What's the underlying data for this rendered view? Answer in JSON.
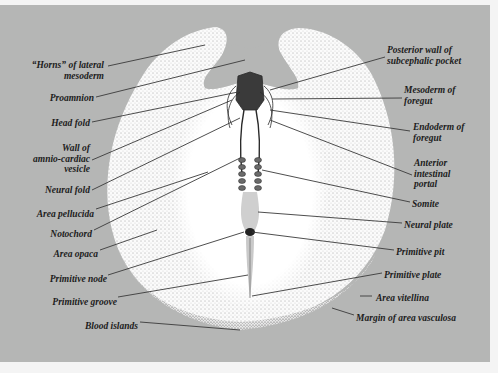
{
  "diagram": {
    "colors": {
      "background": "#b5b6b5",
      "embryo": "#ffffff",
      "text": "#1c1c1c",
      "leader": "#3a3a3a"
    },
    "labels_left": [
      {
        "id": "horns",
        "line1": "“Horns” of lateral",
        "line2": "mesoderm"
      },
      {
        "id": "proamnion",
        "line1": "Proamnion"
      },
      {
        "id": "head-fold",
        "line1": "Head fold"
      },
      {
        "id": "wall-amnio",
        "line1": "Wall of",
        "line2": "amnio-cardiac",
        "line3": "vesicle"
      },
      {
        "id": "neural-fold",
        "line1": "Neural fold"
      },
      {
        "id": "area-pellucida",
        "line1": "Area pellucida"
      },
      {
        "id": "notochord",
        "line1": "Notochord"
      },
      {
        "id": "area-opaca",
        "line1": "Area opaca"
      },
      {
        "id": "primitive-node",
        "line1": "Primitive node"
      },
      {
        "id": "primitive-groove",
        "line1": "Primitive groove"
      },
      {
        "id": "blood-islands",
        "line1": "Blood islands"
      }
    ],
    "labels_right": [
      {
        "id": "posterior-wall",
        "line1": "Posterior wall of",
        "line2": "subcephalic pocket"
      },
      {
        "id": "mesoderm-foregut",
        "line1": "Mesoderm of",
        "line2": "foregut"
      },
      {
        "id": "endoderm-foregut",
        "line1": "Endoderm of",
        "line2": "foregut"
      },
      {
        "id": "anterior-portal",
        "line1": "Anterior",
        "line2": "intestinal",
        "line3": "portal"
      },
      {
        "id": "somite",
        "line1": "Somite"
      },
      {
        "id": "neural-plate",
        "line1": "Neural plate"
      },
      {
        "id": "primitive-pit",
        "line1": "Primitive pit"
      },
      {
        "id": "primitive-plate",
        "line1": "Primitive plate"
      },
      {
        "id": "area-vitellina",
        "line1": "Area vitellina"
      },
      {
        "id": "margin-vasculosa",
        "line1": "Margin of area vasculosa"
      }
    ]
  }
}
